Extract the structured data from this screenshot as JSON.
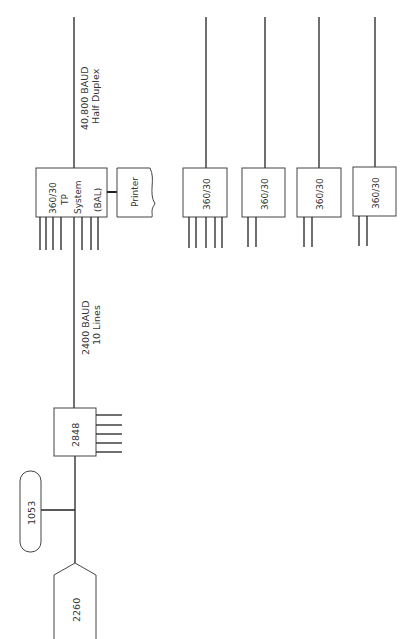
{
  "diagram": {
    "orientation": "rotated-90-ccw",
    "line_color": "#222222",
    "background": "#ffffff",
    "central_system": {
      "lines": [
        "360/30",
        "TP",
        "System",
        "(BAL)"
      ]
    },
    "printer": {
      "label": "Printer"
    },
    "upstream_link": {
      "line1": "40,800 BAUD",
      "line2": "Half Duplex"
    },
    "downstream_link": {
      "line1": "2400 BAUD",
      "line2": "10 Lines"
    },
    "controller": {
      "label": "2848"
    },
    "console": {
      "label": "1053"
    },
    "terminal": {
      "label": "2260"
    },
    "remote_systems": [
      {
        "label": "360/30",
        "stubs": 5
      },
      {
        "label": "360/30",
        "stubs": 2
      },
      {
        "label": "360/30",
        "stubs": 2
      },
      {
        "label": "360/30",
        "stubs": 2
      }
    ]
  }
}
